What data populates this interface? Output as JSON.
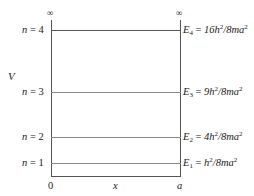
{
  "diagram": {
    "title": "",
    "type": "particle-in-a-box energy levels",
    "axis": {
      "vertical_label": "V",
      "horizontal_label": "x",
      "left_bound_label": "0",
      "right_bound_label": "a",
      "infinity_symbol": "∞"
    },
    "levels": [
      {
        "n_label": "n = 4",
        "n": "4",
        "energy_sub": "4",
        "energy_expr": "16h",
        "energy_rest": "/8ma",
        "full": "E4 = 16h²/8ma²"
      },
      {
        "n_label": "n = 3",
        "n": "3",
        "energy_sub": "3",
        "energy_expr": "9h",
        "energy_rest": "/8ma",
        "full": "E3 = 9h²/8ma²"
      },
      {
        "n_label": "n = 2",
        "n": "2",
        "energy_sub": "2",
        "energy_expr": "4h",
        "energy_rest": "/8ma",
        "full": "E2 = 4h²/8ma²"
      },
      {
        "n_label": "n = 1",
        "n": "1",
        "energy_sub": "1",
        "energy_expr": "h",
        "energy_rest": "/8ma",
        "full": "E1 = h²/8ma²"
      }
    ],
    "symbols": {
      "n": "n",
      "equals": " = ",
      "E": "E",
      "two": "2"
    },
    "colors": {
      "wall": "#555555",
      "level_line": "#888888",
      "text": "#222222"
    }
  }
}
